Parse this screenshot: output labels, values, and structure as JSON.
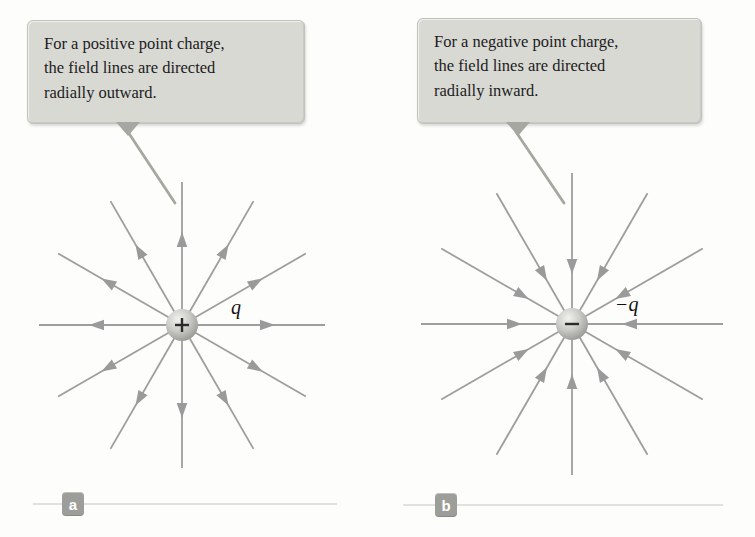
{
  "figure": {
    "background": "#fdfdfb",
    "colors": {
      "field_line": "#9e9e9e",
      "arrow": "#9a9a9a",
      "leader_line": "#a7a7a1",
      "baseline": "#d8d8d2",
      "charge_sign": "#2b2b2b",
      "callout_bg": "#d9d9d4",
      "callout_text": "#1c1c1c",
      "badge_bg": "#9d9d99",
      "badge_text": "#ffffff"
    },
    "panels": [
      {
        "badge": "a",
        "callout_lines": [
          "For a positive point charge,",
          "the field lines are directed",
          "radially outward."
        ],
        "charge_sign": "+",
        "charge_label": "q",
        "direction": "outward",
        "num_lines": 12,
        "center": {
          "x": 182,
          "y": 325
        },
        "outer_radius": 143,
        "sphere_radius": 16,
        "arrow_tip_radius": 93,
        "leader": {
          "x1": 128,
          "y1": 132,
          "x2": 175,
          "y2": 203
        },
        "baseline": {
          "x1": 33,
          "x2": 337,
          "y": 504
        }
      },
      {
        "badge": "b",
        "callout_lines": [
          "For a negative point charge,",
          "the field lines are directed",
          "radially inward."
        ],
        "charge_sign": "−",
        "charge_label": "−q",
        "direction": "inward",
        "num_lines": 12,
        "center": {
          "x": 572,
          "y": 324
        },
        "outer_radius": 151,
        "sphere_radius": 16,
        "arrow_tip_radius": 50,
        "leader": {
          "x1": 516,
          "y1": 132,
          "x2": 564,
          "y2": 203
        },
        "baseline": {
          "x1": 403,
          "x2": 723,
          "y": 505
        }
      }
    ]
  }
}
